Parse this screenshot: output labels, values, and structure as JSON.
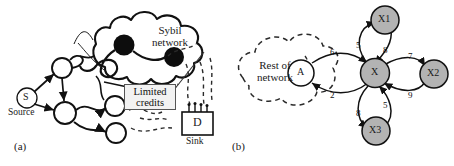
{
  "figure": {
    "panels": [
      {
        "id": "a",
        "caption": "(a)"
      },
      {
        "id": "b",
        "caption": "(b)"
      }
    ],
    "background": "#ffffff",
    "ink": "#111111"
  },
  "panel_a": {
    "caption": "(a)",
    "sybil_cloud": {
      "line1": "Sybil",
      "line2": "network"
    },
    "limited_credits": {
      "line1": "Limited",
      "line2": "credits"
    },
    "source_node": {
      "label": "S",
      "caption": "Source"
    },
    "sink_node": {
      "label": "D",
      "caption": "Sink"
    },
    "colors": {
      "sybil_node_fill": "#0d0d0d",
      "plain_node_fill": "#ffffff",
      "stroke": "#111111",
      "dashed_stroke": "#2a2a2a",
      "credits_box_fill": "#f2f2f2",
      "credits_box_border": "#555555"
    }
  },
  "panel_b": {
    "caption": "(b)",
    "rest_of_network": {
      "line1": "Rest of",
      "line2": "network"
    },
    "nodes": [
      {
        "id": "A",
        "label": "A",
        "fill": "#ffffff"
      },
      {
        "id": "X",
        "label": "X",
        "fill": "#b3b3b3"
      },
      {
        "id": "X1",
        "label": "X1",
        "fill": "#b3b3b3"
      },
      {
        "id": "X2",
        "label": "X2",
        "fill": "#b3b3b3"
      },
      {
        "id": "X3",
        "label": "X3",
        "fill": "#b3b3b3"
      }
    ],
    "edges": [
      {
        "from": "A",
        "to": "X",
        "weight": "6"
      },
      {
        "from": "X",
        "to": "A",
        "weight": "2"
      },
      {
        "from": "X",
        "to": "X1",
        "weight": "5"
      },
      {
        "from": "X1",
        "to": "X",
        "weight": "8"
      },
      {
        "from": "X",
        "to": "X2",
        "weight": "7"
      },
      {
        "from": "X2",
        "to": "X",
        "weight": "9"
      },
      {
        "from": "X",
        "to": "X3",
        "weight": "8"
      },
      {
        "from": "X3",
        "to": "X",
        "weight": "5"
      }
    ],
    "colors": {
      "node_gray": "#b3b3b3",
      "node_white": "#ffffff",
      "stroke": "#111111",
      "dashed_stroke": "#2a2a2a"
    }
  }
}
